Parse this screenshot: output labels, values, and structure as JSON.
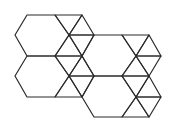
{
  "figure": {
    "type": "hexagon-triangle tessellation",
    "stroke_color": "#2b2b2b",
    "background_color": "#ffffff",
    "hexagon_count": 4,
    "hexagons": [
      {
        "id": "hex-top-left",
        "points": [
          [
            27,
            15
          ],
          [
            55,
            15
          ],
          [
            69,
            35
          ],
          [
            55,
            56
          ],
          [
            27,
            56
          ],
          [
            15,
            35
          ]
        ]
      },
      {
        "id": "hex-bottom-left",
        "points": [
          [
            27,
            56
          ],
          [
            55,
            56
          ],
          [
            69,
            76
          ],
          [
            55,
            97
          ],
          [
            27,
            97
          ],
          [
            15,
            76
          ]
        ]
      },
      {
        "id": "hex-top-right",
        "points": [
          [
            94,
            35
          ],
          [
            122,
            35
          ],
          [
            136,
            56
          ],
          [
            122,
            76
          ],
          [
            94,
            76
          ],
          [
            82,
            56
          ]
        ]
      },
      {
        "id": "hex-bottom-right",
        "points": [
          [
            94,
            76
          ],
          [
            122,
            76
          ],
          [
            136,
            97
          ],
          [
            122,
            117
          ],
          [
            94,
            117
          ],
          [
            82,
            97
          ]
        ]
      }
    ],
    "triangles": [
      [
        [
          55,
          15
        ],
        [
          82,
          15
        ],
        [
          69,
          35
        ]
      ],
      [
        [
          82,
          15
        ],
        [
          94,
          35
        ],
        [
          69,
          35
        ]
      ],
      [
        [
          69,
          35
        ],
        [
          94,
          35
        ],
        [
          82,
          56
        ]
      ],
      [
        [
          55,
          56
        ],
        [
          69,
          35
        ],
        [
          82,
          56
        ]
      ],
      [
        [
          55,
          56
        ],
        [
          82,
          56
        ],
        [
          69,
          76
        ]
      ],
      [
        [
          82,
          56
        ],
        [
          94,
          76
        ],
        [
          69,
          76
        ]
      ],
      [
        [
          69,
          76
        ],
        [
          94,
          76
        ],
        [
          82,
          97
        ]
      ],
      [
        [
          55,
          97
        ],
        [
          69,
          76
        ],
        [
          82,
          97
        ]
      ],
      [
        [
          122,
          35
        ],
        [
          149,
          35
        ],
        [
          136,
          56
        ]
      ],
      [
        [
          149,
          35
        ],
        [
          161,
          56
        ],
        [
          136,
          56
        ]
      ],
      [
        [
          136,
          56
        ],
        [
          161,
          56
        ],
        [
          149,
          76
        ]
      ],
      [
        [
          122,
          76
        ],
        [
          136,
          56
        ],
        [
          149,
          76
        ]
      ],
      [
        [
          122,
          76
        ],
        [
          149,
          76
        ],
        [
          136,
          97
        ]
      ],
      [
        [
          149,
          76
        ],
        [
          161,
          97
        ],
        [
          136,
          97
        ]
      ],
      [
        [
          136,
          97
        ],
        [
          161,
          97
        ],
        [
          149,
          117
        ]
      ],
      [
        [
          122,
          117
        ],
        [
          136,
          97
        ],
        [
          149,
          117
        ]
      ]
    ]
  }
}
